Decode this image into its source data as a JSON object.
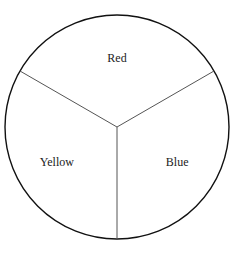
{
  "chart_data": {
    "type": "pie",
    "title": "",
    "categories": [
      "Red",
      "Blue",
      "Yellow"
    ],
    "values": [
      1,
      1,
      1
    ],
    "fill": "none",
    "outline_color": "#111111",
    "divider_color": "#555555"
  }
}
